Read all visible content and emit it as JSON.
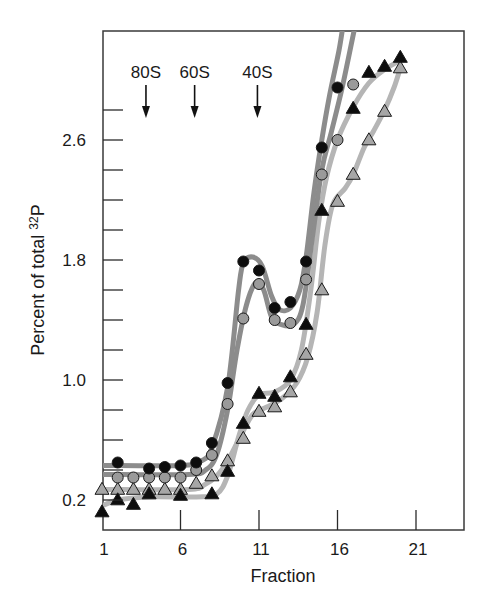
{
  "chart_data": {
    "type": "line",
    "title": "",
    "xlabel": "Fraction",
    "ylabel": "Percent of total",
    "ylabel_superscript": "32",
    "ylabel_suffix": "P",
    "xlim": [
      1,
      24
    ],
    "ylim": [
      0.0,
      3.33
    ],
    "x_ticks": [
      1,
      6,
      11,
      16,
      21
    ],
    "x_tick_labels": [
      "1",
      "6",
      "11",
      "16",
      "21"
    ],
    "y_ticks_major": [
      0.2,
      1.0,
      1.8,
      2.6
    ],
    "y_tick_labels": [
      "0.2",
      "1.0",
      "1.8",
      "2.6"
    ],
    "y_ticks_minor_step": 0.2,
    "y_ticks_minor_range": [
      0.2,
      2.8
    ],
    "grid": false,
    "legend": null,
    "annotations": [
      {
        "label": "80S",
        "x": 3.8,
        "arrow": true
      },
      {
        "label": "60S",
        "x": 6.9,
        "arrow": true
      },
      {
        "label": "40S",
        "x": 10.9,
        "arrow": true
      }
    ],
    "series": [
      {
        "name": "black-circles",
        "marker": "circle",
        "marker_fill": "#0d0d0d",
        "line_color": "#8c8c8c",
        "x": [
          2,
          4,
          5,
          6,
          7,
          8,
          9,
          10,
          11,
          12,
          13,
          14,
          15,
          16
        ],
        "values": [
          0.45,
          0.41,
          0.42,
          0.43,
          0.45,
          0.58,
          0.98,
          1.79,
          1.73,
          1.48,
          1.52,
          1.79,
          2.55,
          2.95
        ],
        "curve": [
          [
            1,
            0.43
          ],
          [
            6,
            0.43
          ],
          [
            7.3,
            0.46
          ],
          [
            8,
            0.55
          ],
          [
            9,
            0.95
          ],
          [
            9.7,
            1.6
          ],
          [
            10,
            1.78
          ],
          [
            10.6,
            1.82
          ],
          [
            11.2,
            1.76
          ],
          [
            11.8,
            1.56
          ],
          [
            12.3,
            1.47
          ],
          [
            13,
            1.48
          ],
          [
            13.6,
            1.6
          ],
          [
            14,
            1.82
          ],
          [
            14.5,
            2.25
          ],
          [
            15,
            2.6
          ],
          [
            15.5,
            2.9
          ],
          [
            16.1,
            3.2
          ],
          [
            16.4,
            3.4
          ]
        ]
      },
      {
        "name": "gray-circles",
        "marker": "circle",
        "marker_fill": "#9a9a9a",
        "line_color": "#8c8c8c",
        "x": [
          2,
          3,
          4,
          5,
          6,
          7,
          8,
          9,
          10,
          11,
          12,
          13,
          14,
          15,
          16,
          17
        ],
        "values": [
          0.35,
          0.35,
          0.35,
          0.35,
          0.35,
          0.4,
          0.5,
          0.84,
          1.41,
          1.64,
          1.4,
          1.38,
          1.67,
          2.37,
          2.6,
          2.97
        ],
        "curve": [
          [
            1,
            0.37
          ],
          [
            6.5,
            0.37
          ],
          [
            7.6,
            0.4
          ],
          [
            8.3,
            0.5
          ],
          [
            9,
            0.8
          ],
          [
            9.6,
            1.2
          ],
          [
            10.2,
            1.5
          ],
          [
            10.8,
            1.65
          ],
          [
            11.3,
            1.6
          ],
          [
            11.8,
            1.42
          ],
          [
            12.4,
            1.37
          ],
          [
            13.2,
            1.37
          ],
          [
            13.8,
            1.5
          ],
          [
            14.4,
            1.95
          ],
          [
            15,
            2.4
          ],
          [
            15.6,
            2.65
          ],
          [
            16.3,
            2.95
          ],
          [
            17,
            3.3
          ],
          [
            17.2,
            3.4
          ]
        ]
      },
      {
        "name": "black-triangles",
        "marker": "triangle",
        "marker_fill": "#0d0d0d",
        "line_color": "#b5b5b5",
        "x": [
          1,
          2,
          3,
          4,
          6,
          8,
          9,
          10,
          11,
          12,
          13,
          14,
          15,
          17,
          18,
          19,
          20
        ],
        "values": [
          0.12,
          0.2,
          0.17,
          0.24,
          0.23,
          0.24,
          0.39,
          0.71,
          0.91,
          0.89,
          1.02,
          1.37,
          2.13,
          2.81,
          3.05,
          3.09,
          3.15
        ],
        "curve": [
          [
            1,
            0.16
          ],
          [
            2,
            0.2
          ],
          [
            4,
            0.22
          ],
          [
            7,
            0.22
          ],
          [
            8.3,
            0.24
          ],
          [
            9,
            0.36
          ],
          [
            9.7,
            0.62
          ],
          [
            10.3,
            0.8
          ],
          [
            11,
            0.9
          ],
          [
            12,
            0.92
          ],
          [
            13,
            1.0
          ],
          [
            13.7,
            1.2
          ],
          [
            14.3,
            1.6
          ],
          [
            14.8,
            2.05
          ],
          [
            15.3,
            2.35
          ],
          [
            16,
            2.6
          ],
          [
            17,
            2.82
          ],
          [
            18,
            2.98
          ],
          [
            19,
            3.07
          ],
          [
            20,
            3.13
          ]
        ]
      },
      {
        "name": "gray-triangles",
        "marker": "triangle",
        "marker_fill": "#a6a6a6",
        "line_color": "#b5b5b5",
        "x": [
          1,
          2,
          3,
          4,
          5,
          6,
          7,
          8,
          9,
          10,
          11,
          12,
          13,
          14,
          15,
          16,
          17,
          18,
          19,
          20
        ],
        "values": [
          0.27,
          0.27,
          0.27,
          0.27,
          0.27,
          0.27,
          0.31,
          0.36,
          0.46,
          0.61,
          0.79,
          0.82,
          0.92,
          1.17,
          1.6,
          2.19,
          2.37,
          2.6,
          2.79,
          3.08
        ],
        "curve": [
          [
            1,
            0.27
          ],
          [
            6.5,
            0.27
          ],
          [
            7.5,
            0.3
          ],
          [
            8.3,
            0.36
          ],
          [
            9,
            0.46
          ],
          [
            9.8,
            0.62
          ],
          [
            10.6,
            0.77
          ],
          [
            11.5,
            0.82
          ],
          [
            12.5,
            0.88
          ],
          [
            13.4,
            0.98
          ],
          [
            14.1,
            1.15
          ],
          [
            14.7,
            1.45
          ],
          [
            15.2,
            1.9
          ],
          [
            15.7,
            2.17
          ],
          [
            16.5,
            2.28
          ],
          [
            17,
            2.37
          ],
          [
            17.7,
            2.55
          ],
          [
            18.3,
            2.66
          ],
          [
            19,
            2.8
          ],
          [
            19.6,
            2.95
          ],
          [
            20,
            3.08
          ]
        ]
      }
    ]
  },
  "axis": {
    "x_title": "Fraction",
    "y_title_main": "Percent of total ",
    "y_title_sup": "32",
    "y_title_tail": "P"
  }
}
